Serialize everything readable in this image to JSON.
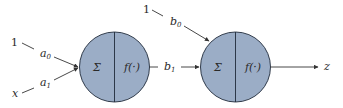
{
  "diagram": {
    "type": "two-layer neuron network",
    "colors": {
      "node_fill": "#9badc6",
      "node_stroke": "#1f2a3a",
      "edge": "#333333",
      "text": "#2a2a2a"
    },
    "nodes": [
      {
        "id": "neuron-1",
        "sum_label": "Σ",
        "activation_label": "f(·)"
      },
      {
        "id": "neuron-2",
        "sum_label": "Σ",
        "activation_label": "f(·)"
      }
    ],
    "inputs": {
      "bias_1": "1",
      "x": "x",
      "bias_2": "1"
    },
    "weights": {
      "a0": {
        "base": "a",
        "sub": "0"
      },
      "a1": {
        "base": "a",
        "sub": "1"
      },
      "b0": {
        "base": "b",
        "sub": "0"
      },
      "b1": {
        "base": "b",
        "sub": "1"
      }
    },
    "output": "z"
  }
}
